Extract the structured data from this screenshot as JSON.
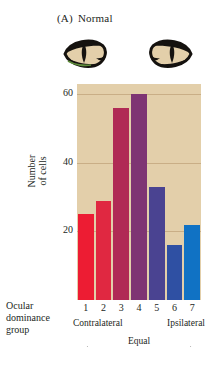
{
  "figure": {
    "panel_tag": "(A)",
    "panel_title": "Normal",
    "background_color": "#e3cfaa"
  },
  "eyes": {
    "left_icon": "cat-eye-icon",
    "right_icon": "cat-eye-icon"
  },
  "axis": {
    "y_title_line1": "Number",
    "y_title_line2": "of cells",
    "y_ticks": [
      "60",
      "40",
      "20"
    ],
    "x_group_label_line1": "Ocular",
    "x_group_label_line2": "dominance",
    "x_group_label_line3": "group",
    "x_categories": [
      "1",
      "2",
      "3",
      "4",
      "5",
      "6",
      "7"
    ],
    "left_side_label": "Contralateral",
    "right_side_label": "Ipsilateral",
    "center_label": "Equal"
  },
  "chart_data": {
    "type": "bar",
    "xlabel": "Ocular dominance group",
    "ylabel": "Number of cells",
    "categories": [
      "1",
      "2",
      "3",
      "4",
      "5",
      "6",
      "7"
    ],
    "values": [
      25,
      29,
      56,
      60,
      33,
      16,
      22
    ],
    "ylim": [
      0,
      63
    ],
    "yticks": [
      20,
      40,
      60
    ],
    "grid": true,
    "legend": false,
    "bar_colors": [
      "#ed1c33",
      "#e02841",
      "#b02a55",
      "#7e3473",
      "#4a4391",
      "#2f50a3",
      "#1072c4"
    ],
    "annotations": {
      "left_side": "Contralateral",
      "right_side": "Ipsilateral",
      "center": "Equal"
    }
  }
}
